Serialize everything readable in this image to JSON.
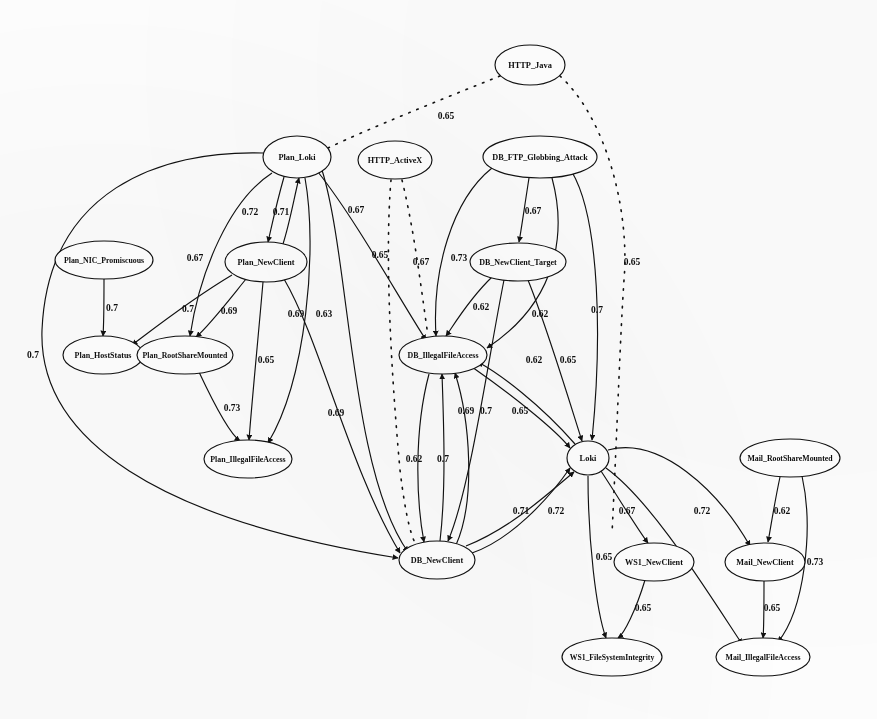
{
  "diagram": {
    "type": "directed-graph",
    "background_color": "#fdfdfd",
    "node_fill": "#ffffff",
    "stroke_color": "#111111",
    "width": 877,
    "height": 719
  },
  "nodes": [
    {
      "id": "HTTP_Java",
      "label": "HTTP_Java",
      "cx": 530,
      "cy": 65,
      "rx": 35,
      "ry": 20,
      "fs": 8.4
    },
    {
      "id": "Plan_Loki",
      "label": "Plan_Loki",
      "cx": 297,
      "cy": 157,
      "rx": 34,
      "ry": 21,
      "fs": 8.4
    },
    {
      "id": "HTTP_ActiveX",
      "label": "HTTP_ActiveX",
      "cx": 395,
      "cy": 160,
      "rx": 37,
      "ry": 19,
      "fs": 8.2
    },
    {
      "id": "DB_FTP_Globbing_Attack",
      "label": "DB_FTP_Globbing_Attack",
      "cx": 540,
      "cy": 157,
      "rx": 57,
      "ry": 21,
      "fs": 8.2
    },
    {
      "id": "Plan_NIC_Promiscuous",
      "label": "Plan_NIC_Promiscuous",
      "cx": 104,
      "cy": 260,
      "rx": 49,
      "ry": 19,
      "fs": 7.8
    },
    {
      "id": "Plan_NewClient",
      "label": "Plan_NewClient",
      "cx": 266,
      "cy": 262,
      "rx": 41,
      "ry": 20,
      "fs": 8.2
    },
    {
      "id": "DB_NewClient_Target",
      "label": "DB_NewClient_Target",
      "cx": 518,
      "cy": 262,
      "rx": 48,
      "ry": 19,
      "fs": 8.0
    },
    {
      "id": "Plan_HostStatus",
      "label": "Plan_HostStatus",
      "cx": 103,
      "cy": 355,
      "rx": 40,
      "ry": 19,
      "fs": 8.0
    },
    {
      "id": "Plan_RootShareMounted",
      "label": "Plan_RootShareMounted",
      "cx": 185,
      "cy": 355,
      "rx": 48,
      "ry": 19,
      "fs": 7.8
    },
    {
      "id": "DB_IllegalFileAccess",
      "label": "DB_IllegalFileAccess",
      "cx": 443,
      "cy": 355,
      "rx": 44,
      "ry": 19,
      "fs": 7.9
    },
    {
      "id": "Plan_IllegalFileAccess",
      "label": "Plan_IllegalFileAccess",
      "cx": 248,
      "cy": 459,
      "rx": 44,
      "ry": 19,
      "fs": 7.9
    },
    {
      "id": "Loki",
      "label": "Loki",
      "cx": 588,
      "cy": 458,
      "rx": 21,
      "ry": 17,
      "fs": 8.4
    },
    {
      "id": "Mail_RootShareMounted",
      "label": "Mail_RootShareMounted",
      "cx": 790,
      "cy": 458,
      "rx": 50,
      "ry": 19,
      "fs": 7.8
    },
    {
      "id": "DB_NewClient",
      "label": "DB_NewClient",
      "cx": 437,
      "cy": 560,
      "rx": 38,
      "ry": 19,
      "fs": 8.2
    },
    {
      "id": "WS1_NewClient",
      "label": "WS1_NewClient",
      "cx": 654,
      "cy": 562,
      "rx": 40,
      "ry": 19,
      "fs": 8.2
    },
    {
      "id": "Mail_NewClient",
      "label": "Mail_NewClient",
      "cx": 765,
      "cy": 562,
      "rx": 40,
      "ry": 19,
      "fs": 8.2
    },
    {
      "id": "WS1_FileSystemIntegrity",
      "label": "WS1_FileSystemIntegrity",
      "cx": 612,
      "cy": 657,
      "rx": 50,
      "ry": 19,
      "fs": 7.7
    },
    {
      "id": "Mail_IllegalFileAccess",
      "label": "Mail_IllegalFileAccess",
      "cx": 763,
      "cy": 657,
      "rx": 47,
      "ry": 19,
      "fs": 7.8
    }
  ],
  "edges": [
    {
      "from": "HTTP_Java",
      "to": "Plan_Loki",
      "weight": "0.65",
      "style": "dotted",
      "d": "M 500,76 C 440,100 370,128 328,148",
      "label_x": 446,
      "label_y": 116,
      "arrow": false
    },
    {
      "from": "HTTP_Java",
      "to": "Loki",
      "weight": "0.65",
      "style": "dotted",
      "d": "M 560,76 C 606,118 630,210 624,280 C 620,340 618,410 612,534",
      "label_x": 632,
      "label_y": 262,
      "arrow": false
    },
    {
      "from": "HTTP_ActiveX",
      "to": "DB_NewClient",
      "weight": "0.67",
      "style": "dotted",
      "d": "M 391,180 C 385,250 390,360 400,470 C 406,520 412,540 418,548",
      "label_x": 421,
      "label_y": 262,
      "arrow": false
    },
    {
      "from": "HTTP_ActiveX",
      "to": "DB_IllegalFileAccess",
      "weight": "0.67",
      "style": "dotted",
      "d": "M 402,180 C 414,230 420,280 428,336",
      "label_x": 356,
      "label_y": 210,
      "arrow": false
    },
    {
      "from": "Plan_Loki",
      "to": "DB_NewClient",
      "weight": "0.7",
      "style": "solid",
      "d": "M 263,153 C 160,150 48,190 42,330 C 38,440 160,520 398,558",
      "label_x": 33,
      "label_y": 355,
      "arrow": true
    },
    {
      "from": "Plan_Loki",
      "to": "Plan_NewClient",
      "weight": "0.72",
      "style": "solid",
      "d": "M 284,177 C 276,205 272,225 268,242",
      "label_x": 250,
      "label_y": 212,
      "arrow": true
    },
    {
      "from": "Plan_NewClient",
      "to": "Plan_Loki",
      "weight": "0.71",
      "style": "solid",
      "d": "M 283,244 C 290,222 294,198 299,178",
      "label_x": 281,
      "label_y": 212,
      "arrow": true
    },
    {
      "from": "Plan_Loki",
      "to": "Plan_RootShareMounted",
      "weight": "0.67",
      "style": "solid",
      "d": "M 272,173 C 230,200 200,270 190,336",
      "label_x": 195,
      "label_y": 258,
      "arrow": true
    },
    {
      "from": "Plan_Loki",
      "to": "Plan_IllegalFileAccess",
      "weight": "0.69",
      "style": "solid",
      "d": "M 305,178 C 318,250 306,380 268,443",
      "label_x": 296,
      "label_y": 314,
      "arrow": true
    },
    {
      "from": "Plan_Loki",
      "to": "DB_IllegalFileAccess",
      "weight": "0.65",
      "style": "solid",
      "d": "M 318,172 C 356,220 400,300 426,340",
      "label_x": 380,
      "label_y": 255,
      "arrow": true
    },
    {
      "from": "Plan_Loki",
      "to": "DB_NewClient",
      "weight": "0.63",
      "style": "solid",
      "d": "M 322,170 C 350,260 350,470 408,552",
      "label_x": 324,
      "label_y": 314,
      "arrow": true
    },
    {
      "from": "Plan_NIC_Promiscuous",
      "to": "Plan_HostStatus",
      "weight": "0.7",
      "style": "solid",
      "d": "M 104,279 C 104,305 104,322 103,336",
      "label_x": 112,
      "label_y": 308,
      "arrow": true
    },
    {
      "from": "Plan_NewClient",
      "to": "Plan_HostStatus",
      "weight": "0.7",
      "style": "solid",
      "d": "M 232,275 C 190,300 152,330 132,345",
      "label_x": 188,
      "label_y": 309,
      "arrow": true
    },
    {
      "from": "Plan_NewClient",
      "to": "Plan_RootShareMounted",
      "weight": "0.69",
      "style": "solid",
      "d": "M 246,279 C 225,305 208,327 196,337",
      "label_x": 229,
      "label_y": 311,
      "arrow": true
    },
    {
      "from": "Plan_NewClient",
      "to": "Plan_IllegalFileAccess",
      "weight": "0.65",
      "style": "solid",
      "d": "M 263,282 C 258,340 252,400 249,440",
      "label_x": 266,
      "label_y": 360,
      "arrow": true
    },
    {
      "from": "Plan_NewClient",
      "to": "DB_NewClient",
      "weight": "0.69",
      "style": "solid",
      "d": "M 284,279 C 320,340 350,470 400,553",
      "label_x": 336,
      "label_y": 413,
      "arrow": true
    },
    {
      "from": "Plan_RootShareMounted",
      "to": "Plan_IllegalFileAccess",
      "weight": "0.73",
      "style": "solid",
      "d": "M 199,372 C 214,404 230,434 240,441",
      "label_x": 232,
      "label_y": 408,
      "arrow": true
    },
    {
      "from": "DB_FTP_Globbing_Attack",
      "to": "DB_IllegalFileAccess",
      "weight": "0.73",
      "style": "solid",
      "d": "M 492,168 C 452,200 432,270 436,336",
      "label_x": 459,
      "label_y": 258,
      "arrow": true
    },
    {
      "from": "DB_FTP_Globbing_Attack",
      "to": "DB_NewClient_Target",
      "weight": "0.67",
      "style": "solid",
      "d": "M 529,178 C 524,210 521,232 519,242",
      "label_x": 533,
      "label_y": 211,
      "arrow": true
    },
    {
      "from": "DB_FTP_Globbing_Attack",
      "to": "DB_IllegalFileAccess",
      "weight": "0.62",
      "style": "solid",
      "d": "M 552,178 C 566,230 560,300 487,348",
      "label_x": 540,
      "label_y": 314,
      "arrow": true
    },
    {
      "from": "DB_FTP_Globbing_Attack",
      "to": "Loki",
      "weight": "0.7",
      "style": "solid",
      "d": "M 572,172 C 600,220 602,340 592,440",
      "label_x": 597,
      "label_y": 310,
      "arrow": true
    },
    {
      "from": "DB_NewClient_Target",
      "to": "DB_IllegalFileAccess",
      "weight": "0.62",
      "style": "solid",
      "d": "M 492,277 C 468,300 452,328 446,336",
      "label_x": 481,
      "label_y": 307,
      "arrow": true
    },
    {
      "from": "DB_NewClient_Target",
      "to": "DB_NewClient",
      "weight": "0.62",
      "style": "solid",
      "d": "M 504,280 C 488,360 470,490 448,541",
      "label_x": 534,
      "label_y": 360,
      "arrow": true
    },
    {
      "from": "DB_NewClient_Target",
      "to": "Loki",
      "weight": "0.65",
      "style": "solid",
      "d": "M 528,280 C 548,330 572,410 582,441",
      "label_x": 568,
      "label_y": 360,
      "arrow": true
    },
    {
      "from": "DB_IllegalFileAccess",
      "to": "DB_NewClient",
      "weight": "0.62",
      "style": "solid",
      "d": "M 429,374 C 414,430 416,500 424,542",
      "label_x": 414,
      "label_y": 459,
      "arrow": true
    },
    {
      "from": "DB_NewClient",
      "to": "DB_IllegalFileAccess",
      "weight": "0.7",
      "style": "solid",
      "d": "M 440,541 C 446,490 444,430 442,374",
      "label_x": 443,
      "label_y": 459,
      "arrow": true
    },
    {
      "from": "DB_NewClient",
      "to": "DB_IllegalFileAccess",
      "weight": "0.69",
      "style": "solid",
      "d": "M 456,545 C 476,500 470,420 455,373",
      "label_x": 466,
      "label_y": 411,
      "arrow": true
    },
    {
      "from": "DB_IllegalFileAccess",
      "to": "Loki",
      "weight": "0.7",
      "style": "solid",
      "d": "M 472,367 C 512,395 556,430 570,448",
      "label_x": 486,
      "label_y": 411,
      "arrow": true
    },
    {
      "from": "Loki",
      "to": "DB_IllegalFileAccess",
      "weight": "0.65",
      "style": "solid",
      "d": "M 575,444 C 540,404 500,374 478,362",
      "label_x": 520,
      "label_y": 411,
      "arrow": true
    },
    {
      "from": "DB_NewClient",
      "to": "Loki",
      "weight": "0.71",
      "style": "solid",
      "d": "M 472,553 C 510,540 548,500 570,468",
      "label_x": 521,
      "label_y": 511,
      "arrow": true
    },
    {
      "from": "DB_NewClient",
      "to": "Loki",
      "weight": "0.72",
      "style": "solid",
      "d": "M 466,546 C 512,528 552,490 574,472",
      "label_x": 556,
      "label_y": 511,
      "arrow": true
    },
    {
      "from": "Loki",
      "to": "WS1_NewClient",
      "weight": "0.67",
      "style": "solid",
      "d": "M 601,471 C 620,500 638,530 648,543",
      "label_x": 627,
      "label_y": 511,
      "arrow": true
    },
    {
      "from": "Loki",
      "to": "WS1_FileSystemIntegrity",
      "weight": "0.65",
      "style": "solid",
      "d": "M 588,476 C 588,540 596,610 606,638",
      "label_x": 604,
      "label_y": 557,
      "arrow": true
    },
    {
      "from": "Loki",
      "to": "Mail_NewClient",
      "weight": "0.72",
      "style": "solid",
      "d": "M 608,450 C 660,436 718,490 750,546",
      "label_x": 702,
      "label_y": 511,
      "arrow": true
    },
    {
      "from": "Loki",
      "to": "Mail_IllegalFileAccess",
      "weight": "0.65",
      "style": "solid",
      "d": "M 606,468 C 650,500 700,580 742,644",
      "label_x": 662,
      "label_y": 557,
      "arrow": true
    },
    {
      "from": "Mail_RootShareMounted",
      "to": "Mail_NewClient",
      "weight": "0.62",
      "style": "solid",
      "d": "M 780,477 C 774,505 770,532 768,542",
      "label_x": 782,
      "label_y": 511,
      "arrow": true
    },
    {
      "from": "Mail_RootShareMounted",
      "to": "Mail_IllegalFileAccess",
      "weight": "0.73",
      "style": "solid",
      "d": "M 802,476 C 814,530 804,610 778,642",
      "label_x": 815,
      "label_y": 562,
      "arrow": true
    },
    {
      "from": "Mail_NewClient",
      "to": "Mail_IllegalFileAccess",
      "weight": "0.65",
      "style": "solid",
      "d": "M 764,581 C 764,610 764,628 763,638",
      "label_x": 772,
      "label_y": 608,
      "arrow": true
    },
    {
      "from": "WS1_NewClient",
      "to": "WS1_FileSystemIntegrity",
      "weight": "0.65",
      "style": "solid",
      "d": "M 645,580 C 636,610 624,634 618,638",
      "label_x": 643,
      "label_y": 608,
      "arrow": true
    }
  ]
}
